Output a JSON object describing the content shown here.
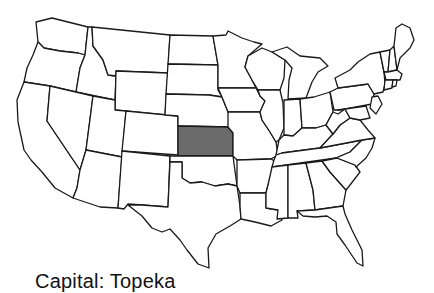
{
  "map": {
    "title": "United States",
    "highlighted_state": "Kansas",
    "highlight_color": "#6b6b6b",
    "border_color": "#1a1a1a",
    "background_color": "#ffffff"
  },
  "caption": {
    "text": "Capital: Topeka"
  }
}
